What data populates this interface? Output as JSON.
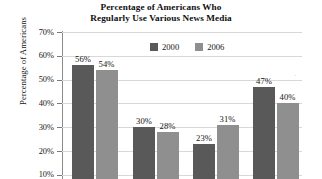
{
  "chart_data": {
    "type": "bar",
    "title": "Percentage of Americans Who Regularly Use Various News Media",
    "title_line1": "Percentage of Americans Who",
    "title_line2": "Regularly Use Various News Media",
    "xlabel": "",
    "ylabel": "Percentage of Americans",
    "ylim": [
      0,
      70
    ],
    "ytick_labels": [
      "70%",
      "60%",
      "50%",
      "40%",
      "30%",
      "20%",
      "10%"
    ],
    "ytick_values": [
      70,
      60,
      50,
      40,
      30,
      20,
      10
    ],
    "grid": true,
    "legend_position": "top-center",
    "categories": [
      "",
      "",
      "",
      ""
    ],
    "series": [
      {
        "name": "2000",
        "color": "#595959",
        "values": [
          56,
          30,
          23,
          47
        ],
        "labels": [
          "56%",
          "30%",
          "23%",
          "47%"
        ]
      },
      {
        "name": "2006",
        "color": "#8f8f8f",
        "values": [
          54,
          28,
          31,
          40
        ],
        "labels": [
          "54%",
          "28%",
          "31%",
          "40%"
        ]
      }
    ]
  },
  "legend": {
    "items": [
      {
        "label": "2000",
        "color": "#595959"
      },
      {
        "label": "2006",
        "color": "#8f8f8f"
      }
    ]
  }
}
